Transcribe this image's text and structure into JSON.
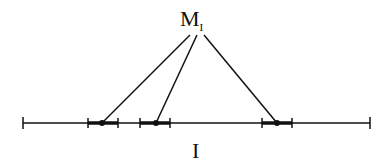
{
  "labels": {
    "top_main": "M",
    "top_sub": "I",
    "bottom": "I"
  },
  "diagram": {
    "axis": {
      "x1": 23,
      "x2": 370,
      "y": 123
    },
    "apex": {
      "x": 197,
      "y": 35
    },
    "intervals": [
      {
        "left": 88,
        "right": 118,
        "point": 102,
        "apex_x": 190
      },
      {
        "left": 140,
        "right": 170,
        "point": 156,
        "apex_x": 197
      },
      {
        "left": 262,
        "right": 292,
        "point": 277,
        "apex_x": 204
      }
    ],
    "color": "#111111"
  }
}
